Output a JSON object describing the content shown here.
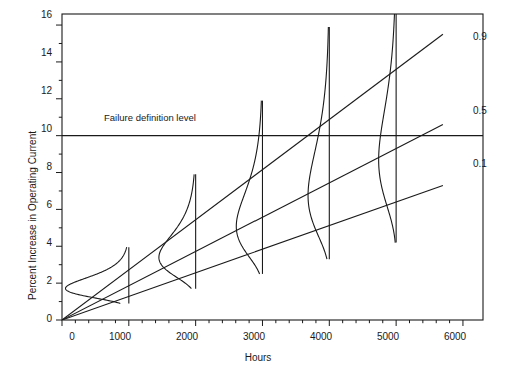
{
  "chart_data": {
    "type": "line",
    "title": "",
    "xlabel": "Hours",
    "ylabel": "Percent Increase in Operating Current",
    "xlim": [
      0,
      6300
    ],
    "ylim": [
      0,
      16.6
    ],
    "xticks": [
      0,
      1000,
      2000,
      3000,
      4000,
      5000,
      6000
    ],
    "xtick_labels": [
      "0",
      "1000",
      "2000",
      "3000",
      "4000",
      "5000",
      "6000"
    ],
    "xminor_step": 200,
    "yticks": [
      0,
      2,
      4,
      6,
      8,
      10,
      12,
      14,
      16
    ],
    "ytick_labels": [
      "0",
      "2",
      "4",
      "6",
      "8",
      "10",
      "12",
      "14",
      "16"
    ],
    "yminor_step": 1,
    "grid": false,
    "legend_position": "right-inline",
    "annotations": [
      {
        "name": "failure-definition-level",
        "text": "Failure definition level",
        "y": 10,
        "x": 1150
      }
    ],
    "reference_lines": [
      {
        "name": "failure-definition-level-line",
        "orientation": "horizontal",
        "y": 10
      }
    ],
    "series": [
      {
        "name": "0.9",
        "quantile": 0.9,
        "label": "0.9",
        "type": "quantile-line",
        "x": [
          0,
          5700
        ],
        "y": [
          0,
          15.5
        ],
        "label_x": 5800,
        "label_y": 15.2
      },
      {
        "name": "0.5",
        "quantile": 0.5,
        "label": "0.5",
        "type": "quantile-line",
        "x": [
          0,
          5700
        ],
        "y": [
          0,
          10.6
        ],
        "label_x": 5800,
        "label_y": 10.4
      },
      {
        "name": "0.1",
        "quantile": 0.1,
        "label": "0.1",
        "type": "quantile-line",
        "x": [
          0,
          5700
        ],
        "y": [
          0,
          7.3
        ],
        "label_x": 5800,
        "label_y": 7.0
      }
    ],
    "distributions": [
      {
        "name": "dist-1000",
        "at_hours": 1000,
        "median": 1.95,
        "low": 0.9,
        "high": 3.95,
        "mode": 1.9,
        "spread_hours": 900
      },
      {
        "name": "dist-2000",
        "at_hours": 2000,
        "median": 3.9,
        "low": 1.7,
        "high": 7.9,
        "mode": 3.8,
        "spread_hours": 520
      },
      {
        "name": "dist-3000",
        "at_hours": 3000,
        "median": 5.9,
        "low": 2.5,
        "high": 11.9,
        "mode": 5.7,
        "spread_hours": 370
      },
      {
        "name": "dist-4000",
        "at_hours": 4000,
        "median": 7.8,
        "low": 3.3,
        "high": 15.9,
        "mode": 7.6,
        "spread_hours": 300
      },
      {
        "name": "dist-5000",
        "at_hours": 5000,
        "median": 9.8,
        "low": 4.2,
        "high": 16.6,
        "mode": 9.5,
        "spread_hours": 250
      }
    ]
  },
  "axis": {
    "xlabel": "Hours",
    "ylabel": "Percent Increase in Operating Current"
  },
  "annotation": {
    "failure_level": "Failure definition level"
  },
  "quantiles": {
    "q90": "0.9",
    "q50": "0.5",
    "q10": "0.1"
  },
  "colors": {
    "line": "#1a1a1a",
    "axis": "#1a1a1a",
    "background": "#ffffff"
  }
}
